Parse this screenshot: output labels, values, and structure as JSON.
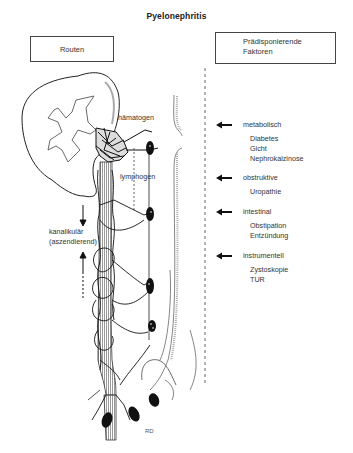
{
  "title": "Pyelonephritis",
  "headers": {
    "left": "Routen",
    "right_line1": "Prädisponierende",
    "right_line2": "Faktoren"
  },
  "routes": {
    "hematogenous": "hämatogen",
    "lymphogenous": "lymphogen",
    "canalicular_line1": "kanalikulär",
    "canalicular_line2": "(aszendierend)"
  },
  "factors": [
    {
      "heading": "metabolisch",
      "items": [
        "Diabetes",
        "Gicht",
        "Nephrokalzinose"
      ]
    },
    {
      "heading": "obstruktive",
      "items": [
        "Uropathie"
      ]
    },
    {
      "heading": "intestinal",
      "items": [
        "Obstipation",
        "Entzündung"
      ]
    },
    {
      "heading": "instrumentell",
      "items": [
        "Zystoskopie",
        "TUR"
      ]
    }
  ],
  "signature": "RD",
  "icons": {
    "factor_arrow": "arrow-left-icon",
    "route_arrow_down": "arrow-down-icon",
    "route_arrow_up": "arrow-up-icon"
  },
  "colors": {
    "ink": "#222222",
    "background": "#ffffff",
    "hatching": "#888888"
  }
}
